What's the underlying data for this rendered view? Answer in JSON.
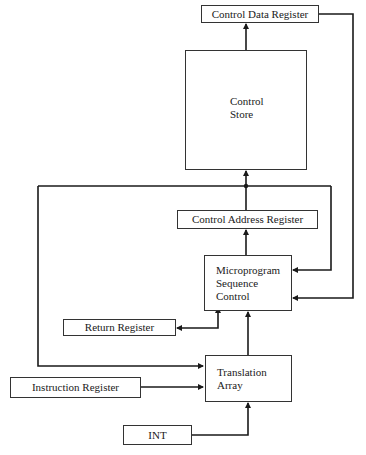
{
  "diagram": {
    "title": "",
    "nodes": {
      "control_data_register": {
        "label": "Control Data Register"
      },
      "control_store": {
        "lines": [
          "Control",
          "Store"
        ]
      },
      "control_address_register": {
        "label": "Control Address Register"
      },
      "microprogram_sequence_control": {
        "lines": [
          "Microprogram",
          "Sequence",
          "Control"
        ]
      },
      "return_register": {
        "label": "Return Register"
      },
      "translation_array": {
        "lines": [
          "Translation",
          "Array"
        ]
      },
      "instruction_register": {
        "label": "Instruction Register"
      },
      "int": {
        "label": "INT"
      }
    },
    "edges": [
      {
        "from": "control_store",
        "to": "control_data_register"
      },
      {
        "from": "control_data_register",
        "to": "microprogram_sequence_control"
      },
      {
        "from": "control_address_register",
        "to": "control_store"
      },
      {
        "from": "control_address_register",
        "to": "microprogram_sequence_control"
      },
      {
        "from": "control_address_register",
        "to": "translation_array"
      },
      {
        "from": "microprogram_sequence_control",
        "to": "control_address_register"
      },
      {
        "from": "microprogram_sequence_control",
        "to": "return_register",
        "bidirectional": true
      },
      {
        "from": "translation_array",
        "to": "microprogram_sequence_control"
      },
      {
        "from": "instruction_register",
        "to": "translation_array"
      },
      {
        "from": "int",
        "to": "translation_array"
      }
    ],
    "line_color": "#1a1a1a"
  }
}
